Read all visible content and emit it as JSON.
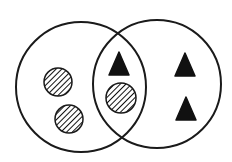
{
  "diagram": {
    "type": "venn",
    "background": "#ffffff",
    "stroke_color": "#1a1a1a",
    "fill_color": "#111111",
    "sets": [
      {
        "name": "left-set",
        "cx": 81,
        "cy": 87,
        "r": 65
      },
      {
        "name": "right-set",
        "cx": 157,
        "cy": 84,
        "r": 64
      }
    ],
    "items": [
      {
        "shape": "hatched-circle",
        "region": "left-only",
        "cx": 58,
        "cy": 82,
        "r": 14
      },
      {
        "shape": "hatched-circle",
        "region": "left-only",
        "cx": 69,
        "cy": 119,
        "r": 14
      },
      {
        "shape": "hatched-circle",
        "region": "intersection",
        "cx": 121,
        "cy": 98,
        "r": 15
      },
      {
        "shape": "filled-triangle",
        "region": "intersection",
        "cx": 119,
        "cy": 65
      },
      {
        "shape": "filled-triangle",
        "region": "right-only",
        "cx": 185,
        "cy": 66
      },
      {
        "shape": "filled-triangle",
        "region": "right-only",
        "cx": 186,
        "cy": 110
      }
    ],
    "counts": {
      "left_only_circles": 2,
      "intersection_circles": 1,
      "intersection_triangles": 1,
      "right_only_triangles": 2
    }
  }
}
